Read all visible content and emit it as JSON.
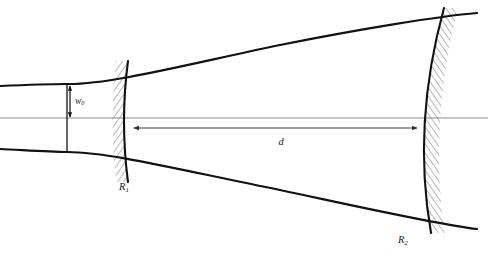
{
  "figure": {
    "background_color": "#ffffff",
    "width": 488,
    "height": 256,
    "line_color": "#111111",
    "axis_color": "#8a8a8a",
    "hatch_color": "#555555",
    "label_color": "#1a1a1a"
  },
  "labels": {
    "waist": {
      "text": "w",
      "subscript": "0",
      "full": "w0",
      "x": 75,
      "y": 104
    },
    "mirror_left": {
      "text": "R",
      "subscript": "1",
      "full": "R1",
      "x": 119,
      "y": 190
    },
    "mirror_right": {
      "text": "R",
      "subscript": "2",
      "full": "R2",
      "x": 398,
      "y": 243
    },
    "separation": {
      "text": "d",
      "subscript": "",
      "full": "d",
      "x": 281,
      "y": 145
    }
  },
  "elements": {
    "optical_axis": {
      "name": "optical-axis",
      "y": 118,
      "x_start": 0,
      "x_end": 488,
      "color": "#8a8a8a"
    },
    "beam_waist_line": {
      "name": "beam-waist-line",
      "x": 67,
      "y_top": 83,
      "y_bottom": 153
    },
    "waist_arrow": {
      "name": "waist-dimension-arrow",
      "x": 70,
      "y_top": 85,
      "y_bottom": 118
    },
    "separation_arrow": {
      "name": "separation-dimension-arrow",
      "y": 128,
      "x_left": 133,
      "x_right": 418
    },
    "mirror_left_arc": {
      "name": "mirror-left-arc",
      "top_x": 128,
      "top_y": 61,
      "apex_x": 121,
      "apex_y": 121,
      "bottom_x": 128,
      "bottom_y": 182,
      "hatch_side": "left"
    },
    "mirror_right_arc": {
      "name": "mirror-right-arc",
      "top_x": 444,
      "top_y": 8,
      "apex_x": 414,
      "apex_y": 127,
      "bottom_x": 431,
      "bottom_y": 233,
      "hatch_side": "right"
    },
    "beam_upper": {
      "name": "beam-envelope-upper",
      "waist_x": 67,
      "waist_y": 84,
      "left_end_x": 0,
      "left_end_y": 86,
      "right_end_x": 477,
      "right_end_y": 13
    },
    "beam_lower": {
      "name": "beam-envelope-lower",
      "waist_x": 67,
      "waist_y": 152,
      "left_end_x": 0,
      "left_end_y": 149,
      "right_end_x": 477,
      "right_end_y": 229
    }
  }
}
